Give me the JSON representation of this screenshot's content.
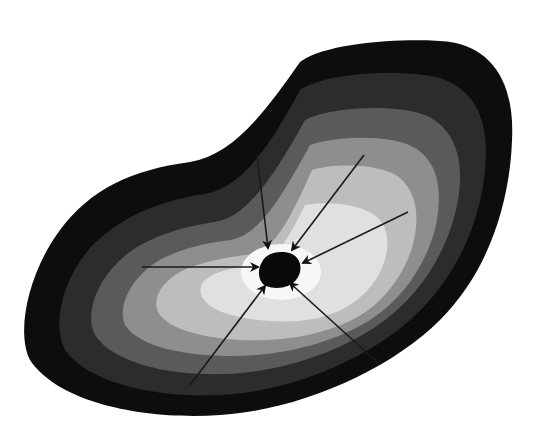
{
  "diagram": {
    "title": "",
    "colors": {
      "background": "#ffffff",
      "outer": "#0d0d0d",
      "inner": "#f4f4f4",
      "core": "#0a0a0a",
      "arrow": "#1a1a1a"
    },
    "center": {
      "x": 281,
      "y": 270
    },
    "arrows": [
      {
        "id": "arrow-top",
        "from": [
          257,
          155
        ],
        "to": [
          268,
          248
        ]
      },
      {
        "id": "arrow-top-right",
        "from": [
          364,
          155
        ],
        "to": [
          292,
          250
        ]
      },
      {
        "id": "arrow-right",
        "from": [
          408,
          212
        ],
        "to": [
          303,
          263
        ]
      },
      {
        "id": "arrow-left",
        "from": [
          142,
          267
        ],
        "to": [
          258,
          267
        ]
      },
      {
        "id": "arrow-lower-right",
        "from": [
          378,
          363
        ],
        "to": [
          290,
          283
        ]
      },
      {
        "id": "arrow-lower-left",
        "from": [
          190,
          385
        ],
        "to": [
          265,
          286
        ]
      }
    ]
  }
}
